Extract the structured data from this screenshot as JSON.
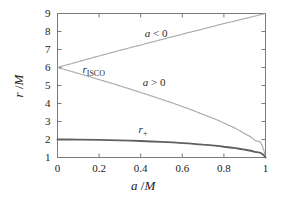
{
  "chart_data": {
    "type": "line",
    "title": "",
    "xlabel": "a /M",
    "ylabel": "r /M",
    "xlim": [
      0,
      1
    ],
    "ylim": [
      1,
      9
    ],
    "grid": false,
    "legend": "inline-annotations",
    "xticks": [
      "0",
      "0.2",
      "0.4",
      "0.6",
      "0.8",
      "1"
    ],
    "xtick_values": [
      0,
      0.2,
      0.4,
      0.6,
      0.8,
      1
    ],
    "yticks": [
      "1",
      "2",
      "3",
      "4",
      "5",
      "6",
      "7",
      "8",
      "9"
    ],
    "ytick_values": [
      1,
      2,
      3,
      4,
      5,
      6,
      7,
      8,
      9
    ],
    "series": [
      {
        "name": "r_ISCO retrograde",
        "annotation": "a < 0",
        "style": "dotted",
        "color": "#a8a8a8",
        "x": [
          0,
          0.1,
          0.2,
          0.3,
          0.4,
          0.5,
          0.6,
          0.7,
          0.8,
          0.9,
          1.0
        ],
        "values": [
          6.0,
          6.32,
          6.64,
          6.95,
          7.25,
          7.55,
          7.85,
          8.14,
          8.44,
          8.72,
          9.0
        ]
      },
      {
        "name": "r_ISCO prograde",
        "annotation": "a > 0",
        "style": "dotted",
        "color": "#a8a8a8",
        "x": [
          0,
          0.1,
          0.2,
          0.3,
          0.4,
          0.5,
          0.6,
          0.7,
          0.8,
          0.9,
          0.95,
          0.99,
          1.0
        ],
        "values": [
          6.0,
          5.67,
          5.33,
          4.98,
          4.61,
          4.23,
          3.83,
          3.39,
          2.91,
          2.32,
          1.94,
          1.45,
          1.0
        ]
      },
      {
        "name": "r_plus",
        "annotation": "r+",
        "style": "solid",
        "color": "#606060",
        "x": [
          0,
          0.1,
          0.2,
          0.3,
          0.4,
          0.5,
          0.6,
          0.7,
          0.8,
          0.9,
          0.95,
          0.99,
          1.0
        ],
        "values": [
          2.0,
          1.995,
          1.98,
          1.954,
          1.917,
          1.866,
          1.8,
          1.714,
          1.6,
          1.436,
          1.312,
          1.141,
          1.0
        ]
      }
    ],
    "annotations": [
      {
        "text": "a < 0",
        "x": 0.42,
        "y": 7.85
      },
      {
        "text": "a > 0",
        "x": 0.41,
        "y": 5.15
      },
      {
        "text": "r_ISCO",
        "x": 0.12,
        "y": 5.85
      },
      {
        "text": "r+",
        "x": 0.39,
        "y": 2.55
      }
    ]
  },
  "labels": {
    "ylabel_var": "r",
    "ylabel_sep": " /",
    "ylabel_unit": "M",
    "xlabel_var": "a",
    "xlabel_sep": " /",
    "xlabel_unit": "M",
    "ann_retrograde_var": "a",
    "ann_retrograde_rel": " < 0",
    "ann_prograde_var": "a",
    "ann_prograde_rel": " > 0",
    "ann_isco_var": "r",
    "ann_isco_sub": "ISCO",
    "ann_rplus_var": "r",
    "ann_rplus_sub": "+"
  },
  "colors": {
    "background": "#ffffff",
    "frame": "#7a7a7a",
    "isco_curve": "#a8a8a8",
    "horizon_curve": "#606060",
    "text": "#1a1a1a"
  }
}
